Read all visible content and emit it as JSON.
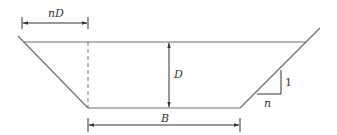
{
  "diagram": {
    "labels": {
      "top_offset": "nD",
      "depth": "D",
      "bottom_width": "B",
      "slope_horizontal": "n",
      "slope_vertical": "1"
    },
    "colors": {
      "channel_outline": "#6e6e6e",
      "dimension_lines": "#333333",
      "background": "#ffffff"
    }
  }
}
